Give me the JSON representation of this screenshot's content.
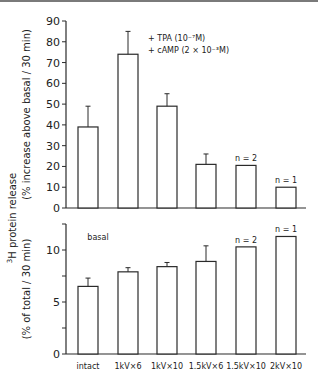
{
  "chart_data": [
    {
      "type": "bar",
      "panel": "upper",
      "title": "",
      "xlabel": "",
      "ylabel": "(% increase above basal / 30 min)",
      "ylim": [
        0,
        90
      ],
      "yticks": [
        0,
        10,
        20,
        30,
        40,
        50,
        60,
        70,
        80,
        90
      ],
      "categories": [
        "intact",
        "1kV×6",
        "1kV×10",
        "1.5kV×6",
        "1.5kV×10",
        "2kV×10"
      ],
      "values": [
        39,
        74,
        49,
        21,
        20.5,
        10
      ],
      "error_upper": [
        49,
        85,
        55,
        26,
        null,
        null
      ],
      "annotations": [
        "",
        "",
        "",
        "",
        "n = 2",
        "n = 1"
      ],
      "legend": [
        "+ TPA (10⁻⁷M)",
        "+ cAMP (2 × 10⁻³M)"
      ],
      "legend_position": "top-right",
      "grid": false
    },
    {
      "type": "bar",
      "panel": "lower",
      "title": "",
      "xlabel": "",
      "ylabel": "(% of total / 30 min)",
      "ylim": [
        0,
        12.5
      ],
      "yticks": [
        0,
        2.5,
        5,
        7.5,
        10,
        12.5
      ],
      "ytick_labels": [
        "0",
        "",
        "5",
        "",
        "10",
        ""
      ],
      "categories": [
        "intact",
        "1kV×6",
        "1kV×10",
        "1.5kV×6",
        "1.5kV×10",
        "2kV×10"
      ],
      "values": [
        6.5,
        7.9,
        8.4,
        8.9,
        10.3,
        11.3
      ],
      "error_upper": [
        7.3,
        8.3,
        8.8,
        10.4,
        null,
        null
      ],
      "annotations": [
        "",
        "",
        "",
        "",
        "n = 2",
        "n = 1"
      ],
      "inset_label": "basal",
      "grid": false
    }
  ],
  "shared_ylabel_main": "³H protein release",
  "shared_ylabel_sup": "3",
  "shared_ylabel_text": "H protein release"
}
